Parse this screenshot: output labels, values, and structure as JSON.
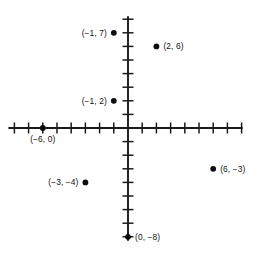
{
  "figure": {
    "width": 262,
    "height": 260,
    "background": "#ffffff",
    "ink_color": "#111111"
  },
  "chart_data": {
    "type": "scatter",
    "title": "",
    "xlabel": "",
    "ylabel": "",
    "xlim": [
      -8,
      8
    ],
    "ylim": [
      -9,
      9
    ],
    "grid": false,
    "legend": false,
    "axes": {
      "x_axis_visible": true,
      "y_axis_visible": true,
      "tick_interval": 1,
      "tick_labels_shown": false,
      "x_ticks_left_count": 8,
      "x_ticks_right_count": 8,
      "y_ticks_up_count": 8,
      "y_ticks_down_count": 8
    },
    "points": [
      {
        "label": "(−1, 7)",
        "x": -1,
        "y": 7,
        "label_side": "left"
      },
      {
        "label": "(2, 6)",
        "x": 2,
        "y": 6,
        "label_side": "right"
      },
      {
        "label": "(−1, 2)",
        "x": -1,
        "y": 2,
        "label_side": "left"
      },
      {
        "label": "(−6, 0)",
        "x": -6,
        "y": 0,
        "label_side": "below"
      },
      {
        "label": "(−3, −4)",
        "x": -3,
        "y": -4,
        "label_side": "left"
      },
      {
        "label": "(6, −3)",
        "x": 6,
        "y": -3,
        "label_side": "right"
      },
      {
        "label": "(0, −8)",
        "x": 0,
        "y": -8,
        "label_side": "right"
      }
    ]
  }
}
